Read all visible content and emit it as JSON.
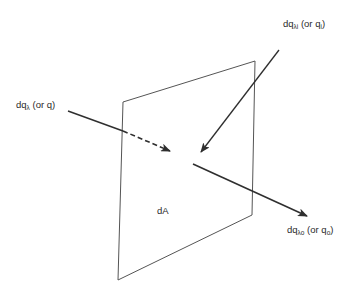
{
  "diagram": {
    "type": "radiant flux through differential area",
    "surface": {
      "label": "dA",
      "corners": {
        "top_left": [
          123,
          102
        ],
        "top_right": [
          255,
          61
        ],
        "bottom_right": [
          252,
          215
        ],
        "bottom_left": [
          118,
          280
        ]
      }
    },
    "arrows": [
      {
        "id": "incident-left",
        "label_main": "dq",
        "label_sub": "λ",
        "label_rest": " (or q)",
        "start": [
          68,
          111
        ],
        "cross": [
          123,
          131
        ],
        "end": [
          170,
          151
        ],
        "behind_plane_dashed": true
      },
      {
        "id": "incident-top",
        "label_main": "dq",
        "label_sub": "λi",
        "label_rest": " (or q",
        "label_rest_sub": "i",
        "label_close": ")",
        "start": [
          279,
          50
        ],
        "end": [
          201,
          152
        ]
      },
      {
        "id": "outgoing",
        "label_main": "dq",
        "label_sub": "λo",
        "label_rest": " (or q",
        "label_rest_sub": "o",
        "label_close": ")",
        "start": [
          193,
          164
        ],
        "end": [
          307,
          216
        ]
      }
    ],
    "colors": {
      "line": "#333333",
      "plane": "#555555",
      "background": "#ffffff"
    }
  }
}
